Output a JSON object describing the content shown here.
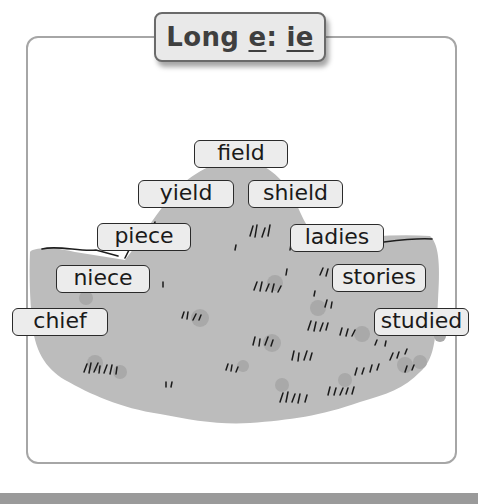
{
  "title": {
    "prefix": "Long ",
    "vowel": "e",
    "separator": ": ",
    "spelling": "ie"
  },
  "words": [
    {
      "id": "field",
      "text": "field",
      "x": 194,
      "y": 140,
      "w": 94
    },
    {
      "id": "yield",
      "text": "yield",
      "x": 138,
      "y": 180,
      "w": 96
    },
    {
      "id": "shield",
      "text": "shield",
      "x": 248,
      "y": 180,
      "w": 95
    },
    {
      "id": "piece",
      "text": "piece",
      "x": 97,
      "y": 223,
      "w": 94
    },
    {
      "id": "ladies",
      "text": "ladies",
      "x": 290,
      "y": 224,
      "w": 94
    },
    {
      "id": "niece",
      "text": "niece",
      "x": 56,
      "y": 265,
      "w": 94
    },
    {
      "id": "stories",
      "text": "stories",
      "x": 332,
      "y": 264,
      "w": 94
    },
    {
      "id": "chief",
      "text": "chief",
      "x": 12,
      "y": 308,
      "w": 96
    },
    {
      "id": "studied",
      "text": "studied",
      "x": 374,
      "y": 308,
      "w": 95
    }
  ],
  "colors": {
    "hill": "#bcbcbc",
    "hill_spots": "#a8a8a8",
    "frame_border": "#a6a6a6",
    "label_bg": "#ececec",
    "title_bg": "#e9e9e9"
  }
}
